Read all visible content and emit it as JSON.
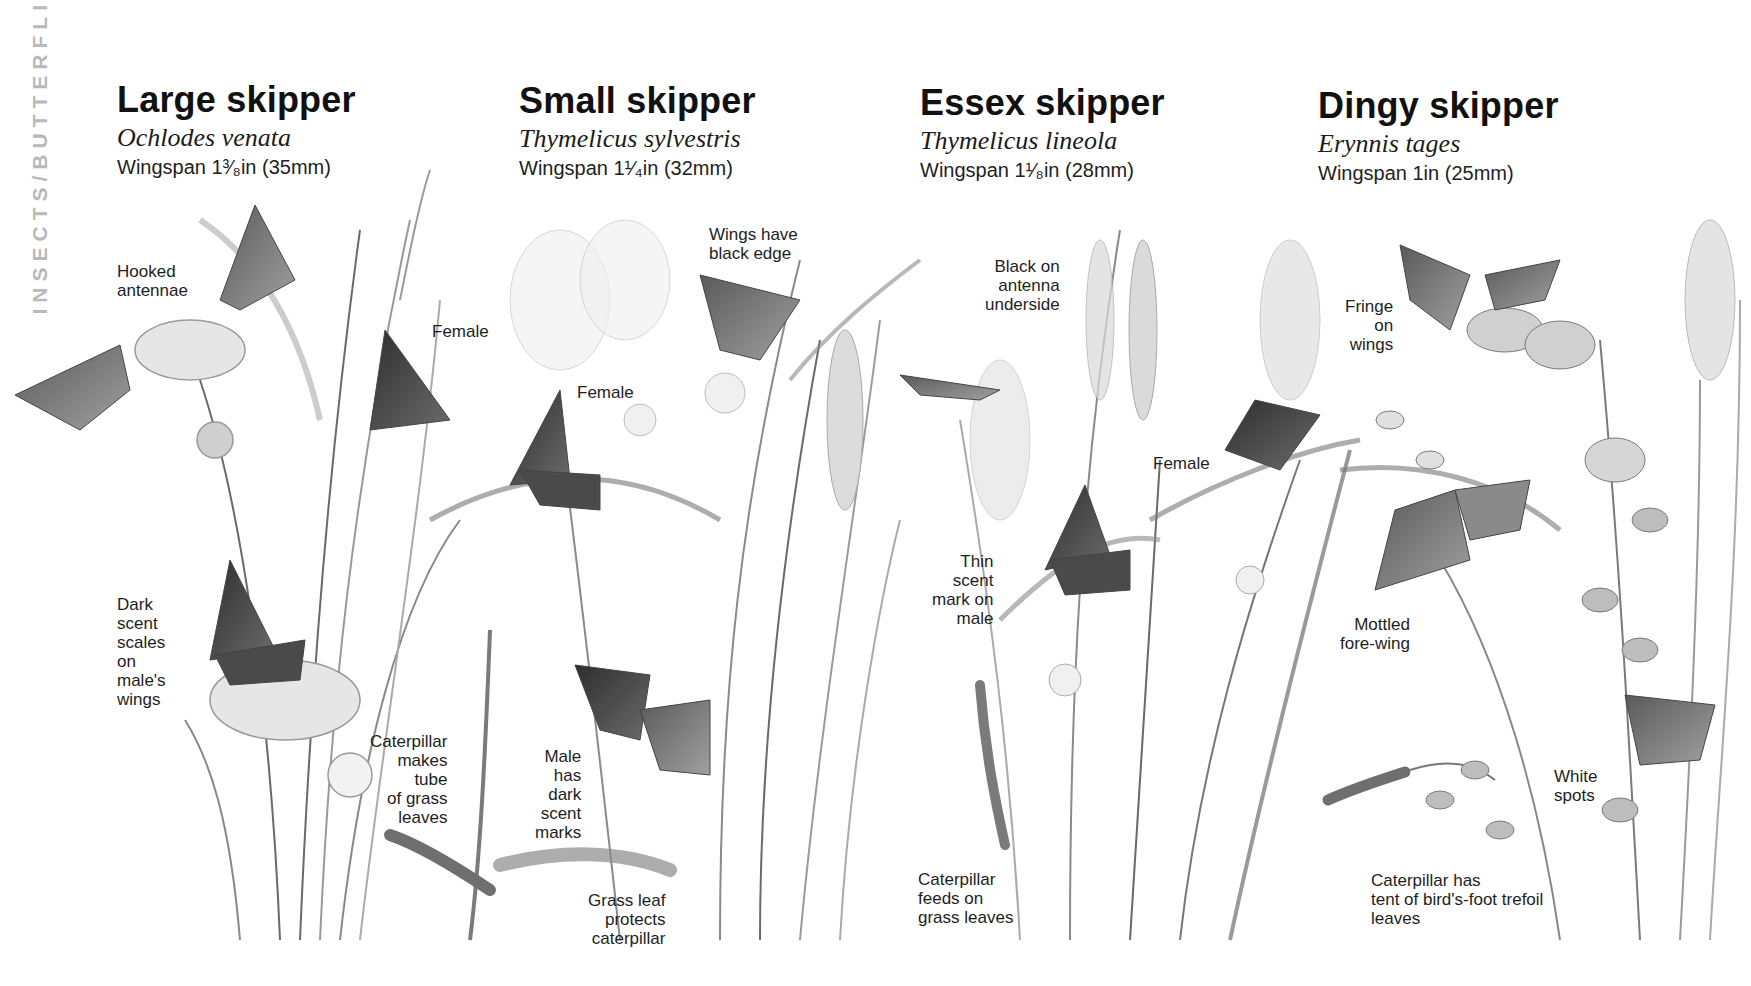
{
  "side_tab": {
    "text": "INSECTS/BUTTERFLIES"
  },
  "species": [
    {
      "common_name": "Large skipper",
      "latin_name": "Ochlodes venata",
      "wingspan": "Wingspan 1³⁄₈in (35mm)",
      "labels": [
        {
          "text": "Hooked\nantennae"
        },
        {
          "text": "Female"
        },
        {
          "text": "Dark\nscent\nscales\non\nmale's\nwings"
        },
        {
          "text": "Caterpillar\nmakes\ntube\nof grass\nleaves"
        }
      ]
    },
    {
      "common_name": "Small skipper",
      "latin_name": "Thymelicus sylvestris",
      "wingspan": "Wingspan 1¹⁄₄in (32mm)",
      "labels": [
        {
          "text": "Wings have\nblack edge"
        },
        {
          "text": "Female"
        },
        {
          "text": "Male\nhas\ndark\nscent\nmarks"
        },
        {
          "text": "Grass leaf\nprotects\ncaterpillar"
        }
      ]
    },
    {
      "common_name": "Essex skipper",
      "latin_name": "Thymelicus lineola",
      "wingspan": "Wingspan 1¹⁄₈in (28mm)",
      "labels": [
        {
          "text": "Black on\nantenna\nunderside"
        },
        {
          "text": "Female"
        },
        {
          "text": "Thin\nscent\nmark on\nmale"
        },
        {
          "text": "Caterpillar\nfeeds on\ngrass leaves"
        }
      ]
    },
    {
      "common_name": "Dingy skipper",
      "latin_name": "Erynnis tages",
      "wingspan": "Wingspan 1in (25mm)",
      "labels": [
        {
          "text": "Fringe\non\nwings"
        },
        {
          "text": "Mottled\nfore-wing"
        },
        {
          "text": "White\nspots"
        },
        {
          "text": "Caterpillar has\ntent of bird's-foot trefoil\nleaves"
        }
      ]
    }
  ],
  "colors": {
    "background": "#ffffff",
    "text": "#1a1a1a",
    "side_tab": "#b9b9b9",
    "illustration_dark": "#3a3a3a",
    "illustration_mid": "#8a8a8a",
    "illustration_light": "#c8c8c8"
  }
}
